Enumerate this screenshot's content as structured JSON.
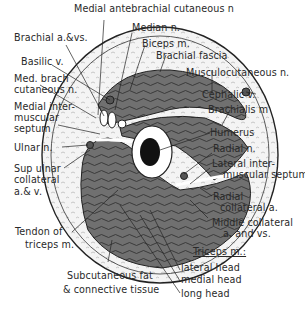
{
  "diagram": {
    "labels": {
      "medial_antebrachial": "Medial antebrachial cutaneous n",
      "median": "Median n.",
      "biceps": "Biceps m.",
      "brachial_fascia": "Brachial fascia",
      "musculocutaneous": "Musculocutaneous n.",
      "cephalic": "Cephalic v.",
      "brachialis": "Brachialis m",
      "humerus": "Humerus",
      "radial_n": "Radial n.",
      "lateral_septum_1": "Lateral inter-",
      "lateral_septum_2": "muscular septum",
      "radial_collat_1": "Radial",
      "radial_collat_2": "collateral   a.",
      "middle_collat_1": "Middle collateral",
      "middle_collat_2": "a. and vs.",
      "triceps": "Triceps m.:",
      "lateral_head": "lateral head",
      "medial_head": "medial head",
      "long_head": "long head",
      "subcut_1": "Subcutaneous fat",
      "subcut_2": "& connective tissue",
      "tendon_1": "Tendon of",
      "tendon_2": "triceps m.",
      "brachial_avs": "Brachial a.&vs.",
      "basilic": "Basilic v.",
      "med_brach_1": "Med. brach",
      "med_brach_2": "cutaneous n.",
      "medial_septum_1": "Medial inter-",
      "medial_septum_2": "muscular",
      "medial_septum_3": "septum",
      "ulnar": "Ulnar n.",
      "sup_ulnar_1": "Sup ulnar",
      "sup_ulnar_2": "collateral",
      "sup_ulnar_3": "a.& v."
    },
    "colors": {
      "muscle": "#6f6f6f",
      "skin": "#f4f4f4",
      "bone": "#ffffff",
      "marrow": "#111111",
      "line": "#222222"
    }
  }
}
